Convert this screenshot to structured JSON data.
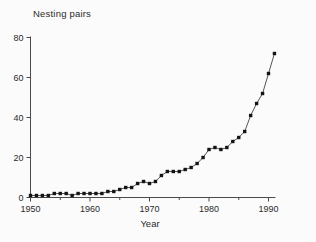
{
  "chart": {
    "title": "Nesting pairs",
    "xlabel": "Year"
  },
  "chart_data": {
    "type": "line",
    "title": "Nesting pairs",
    "xlabel": "Year",
    "ylabel": "Nesting pairs",
    "x": [
      1950,
      1951,
      1952,
      1953,
      1954,
      1955,
      1956,
      1957,
      1958,
      1959,
      1960,
      1961,
      1962,
      1963,
      1964,
      1965,
      1966,
      1967,
      1968,
      1969,
      1970,
      1971,
      1972,
      1973,
      1974,
      1975,
      1976,
      1977,
      1978,
      1979,
      1980,
      1981,
      1982,
      1983,
      1984,
      1985,
      1986,
      1987,
      1988,
      1989,
      1990,
      1991
    ],
    "values": [
      1,
      1,
      1,
      1,
      2,
      2,
      2,
      1,
      2,
      2,
      2,
      2,
      2,
      3,
      3,
      4,
      5,
      5,
      7,
      8,
      7,
      8,
      11,
      13,
      13,
      13,
      14,
      15,
      17,
      20,
      24,
      25,
      24,
      25,
      28,
      30,
      33,
      41,
      47,
      52,
      62,
      72
    ],
    "marker": "filled-square",
    "line_style": "solid-thin",
    "xlim": [
      1950,
      1992
    ],
    "ylim": [
      0,
      80
    ],
    "x_major_ticks": [
      1950,
      1960,
      1970,
      1980,
      1990
    ],
    "x_minor_ticks": [
      1955,
      1965,
      1975,
      1985
    ],
    "y_ticks": [
      0,
      20,
      40,
      60,
      80
    ],
    "grid": false,
    "legend": "none",
    "colors": {
      "line": "#2a2a2a",
      "marker": "#141414",
      "axis": "#4a4a4a",
      "text": "#2b2b2b",
      "background": "#fbfbfb"
    }
  }
}
